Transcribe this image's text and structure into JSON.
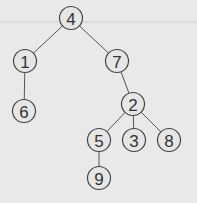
{
  "diagram": {
    "type": "tree",
    "nodes": [
      {
        "id": "4",
        "label": "4",
        "x": 71,
        "y": 18
      },
      {
        "id": "1",
        "label": "1",
        "x": 25,
        "y": 61
      },
      {
        "id": "7",
        "label": "7",
        "x": 117,
        "y": 61
      },
      {
        "id": "6",
        "label": "6",
        "x": 24,
        "y": 111
      },
      {
        "id": "2",
        "label": "2",
        "x": 133,
        "y": 104
      },
      {
        "id": "5",
        "label": "5",
        "x": 99,
        "y": 140
      },
      {
        "id": "3",
        "label": "3",
        "x": 134,
        "y": 140
      },
      {
        "id": "8",
        "label": "8",
        "x": 169,
        "y": 140
      },
      {
        "id": "9",
        "label": "9",
        "x": 99,
        "y": 178
      }
    ],
    "edges": [
      [
        "4",
        "1"
      ],
      [
        "4",
        "7"
      ],
      [
        "1",
        "6"
      ],
      [
        "7",
        "2"
      ],
      [
        "2",
        "5"
      ],
      [
        "2",
        "3"
      ],
      [
        "2",
        "8"
      ],
      [
        "5",
        "9"
      ]
    ]
  }
}
